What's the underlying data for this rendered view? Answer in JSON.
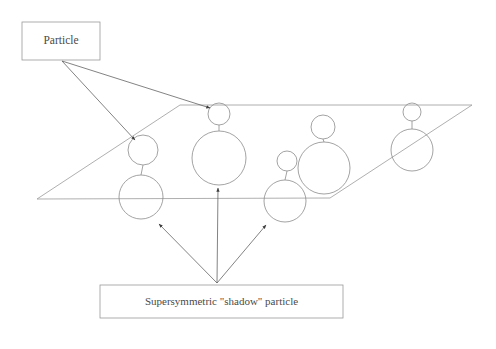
{
  "figure": {
    "background_color": "#ffffff",
    "line_color": "#8c8c8c",
    "arrow_color": "#5a5a5a",
    "box_border_color": "#9a9a9a",
    "text_color": "#4a4a4a",
    "width": 496,
    "height": 349
  },
  "labels": {
    "particle_box": {
      "text": "Particle",
      "x": 22,
      "y": 22,
      "width": 78,
      "height": 38
    },
    "shadow_box": {
      "text": "Supersymmetric \"shadow\" particle",
      "x": 100,
      "y": 285,
      "width": 243,
      "height": 33
    }
  },
  "plane": {
    "description": "parallelogram representing a plane",
    "corners": [
      {
        "x": 180,
        "y": 105
      },
      {
        "x": 472,
        "y": 105
      },
      {
        "x": 330,
        "y": 198
      },
      {
        "x": 37,
        "y": 199
      }
    ]
  },
  "particle_pairs": [
    {
      "id": 1,
      "particle": {
        "cx": 143,
        "cy": 150,
        "r": 15
      },
      "shadow": {
        "cx": 141,
        "cy": 197,
        "r": 22
      }
    },
    {
      "id": 2,
      "particle": {
        "cx": 219,
        "cy": 114,
        "r": 11
      },
      "shadow": {
        "cx": 219,
        "cy": 158,
        "r": 27
      }
    },
    {
      "id": 3,
      "particle": {
        "cx": 287,
        "cy": 161,
        "r": 10
      },
      "shadow": {
        "cx": 285,
        "cy": 201,
        "r": 21
      }
    },
    {
      "id": 4,
      "particle": {
        "cx": 323,
        "cy": 127,
        "r": 12
      },
      "shadow": {
        "cx": 324,
        "cy": 168,
        "r": 26
      }
    },
    {
      "id": 5,
      "particle": {
        "cx": 412,
        "cy": 112,
        "r": 9
      },
      "shadow": {
        "cx": 412,
        "cy": 150,
        "r": 21
      }
    }
  ],
  "arrows": {
    "from_particle_box": [
      {
        "x1": 62,
        "y1": 61,
        "x2": 135,
        "y2": 140
      },
      {
        "x1": 62,
        "y1": 61,
        "x2": 210,
        "y2": 108
      }
    ],
    "from_shadow_box": [
      {
        "x1": 217,
        "y1": 283,
        "x2": 159,
        "y2": 224
      },
      {
        "x1": 217,
        "y1": 283,
        "x2": 218,
        "y2": 188
      },
      {
        "x1": 217,
        "y1": 283,
        "x2": 266,
        "y2": 225
      }
    ]
  }
}
